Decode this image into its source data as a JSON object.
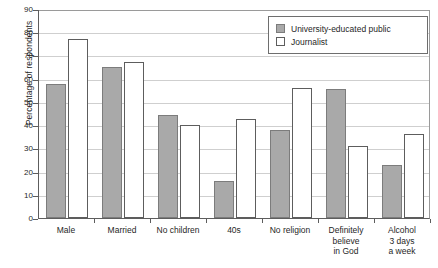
{
  "chart_data": {
    "type": "bar",
    "title": "",
    "subtitle": "",
    "xlabel": "",
    "ylabel": "Percentage of respondents",
    "ylim": [
      0,
      90
    ],
    "ytick_step": 10,
    "yticks": [
      0,
      10,
      20,
      30,
      40,
      50,
      60,
      70,
      80,
      90
    ],
    "ytick_labels": [
      "0",
      "10",
      "20",
      "30",
      "40",
      "50",
      "60",
      "70",
      "80",
      "90"
    ],
    "grid": true,
    "grid_axis": "y",
    "legend_position": "top-right",
    "categories": [
      "Male",
      "Married",
      "No children",
      "40s",
      "No religion",
      "Definitely believe in God",
      "Alcohol 3 days a week"
    ],
    "category_lines": [
      [
        "Male"
      ],
      [
        "Married"
      ],
      [
        "No children"
      ],
      [
        "40s"
      ],
      [
        "No religion"
      ],
      [
        "Definitely",
        "believe",
        "in God"
      ],
      [
        "Alcohol",
        "3 days",
        "a week"
      ]
    ],
    "series": [
      {
        "name": "University-educated public",
        "color": "#a9a9a9",
        "edge_color": "#7c7c7c",
        "values": [
          57.5,
          65,
          44.5,
          16,
          38,
          55.5,
          23
        ]
      },
      {
        "name": "Journalist",
        "color": "#ffffff",
        "edge_color": "#5d5d5d",
        "values": [
          77,
          67,
          40,
          42.5,
          56,
          31,
          36
        ]
      }
    ]
  },
  "legend": {
    "entries": [
      {
        "label": "University-educated public",
        "swatch": "gray-filled-square"
      },
      {
        "label": "Journalist",
        "swatch": "white-outline-square"
      }
    ]
  },
  "colors": {
    "series_university": "#a9a9a9",
    "series_journalist": "#ffffff",
    "axis": "#5d5d5d",
    "gridline": "#cfcfcf",
    "background": "#ffffff",
    "text": "#1f1f1f"
  }
}
